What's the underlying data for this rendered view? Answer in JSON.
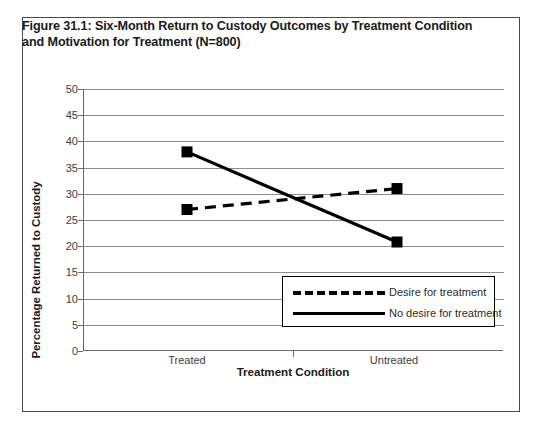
{
  "figure": {
    "title": "Figure 31.1: Six-Month Return to Custody Outcomes by Treatment Condition and Motivation for Treatment (N=800)"
  },
  "axes": {
    "y_title": "Percentage Returned to Custody",
    "x_title": "Treatment Condition"
  },
  "legend": {
    "entries": [
      {
        "label": "Desire for treatment",
        "style": "dashed"
      },
      {
        "label": "No desire for treatment",
        "style": "solid"
      }
    ]
  },
  "colors": {
    "series_line": "#000000",
    "gridline": "#8c8c8c",
    "axis": "#6b6b6b",
    "frame": "#4a4a4a",
    "text": "#1a1a1a",
    "background": "#ffffff"
  },
  "chart_data": {
    "type": "line",
    "title": "Figure 31.1: Six-Month Return to Custody Outcomes by Treatment Condition and Motivation for Treatment (N=800)",
    "xlabel": "Treatment Condition",
    "ylabel": "Percentage Returned to Custody",
    "categories": [
      "Treated",
      "Untreated"
    ],
    "yticks": [
      0,
      5,
      10,
      15,
      20,
      25,
      30,
      35,
      40,
      45,
      50
    ],
    "ylim": [
      0,
      50
    ],
    "grid": true,
    "legend_position": "inside-lower-right",
    "series": [
      {
        "name": "Desire for treatment",
        "style": "dashed",
        "marker": "square",
        "values": [
          27,
          31
        ]
      },
      {
        "name": "No desire for treatment",
        "style": "solid",
        "marker": "square",
        "values": [
          38,
          20.8
        ]
      }
    ]
  }
}
